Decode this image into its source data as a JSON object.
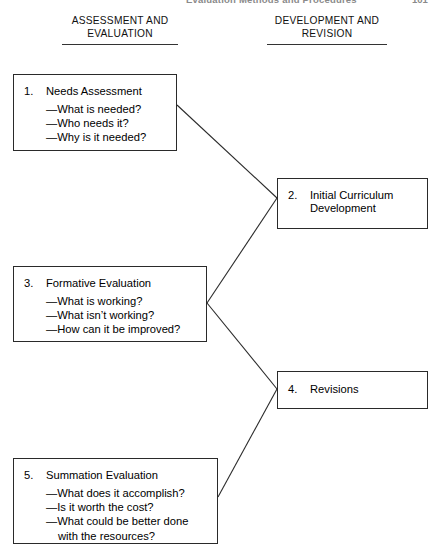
{
  "running_head": {
    "title": "Evaluation Methods and Procedures",
    "page_number": "101"
  },
  "columns": [
    {
      "id": "assessment-evaluation",
      "line1": "ASSESSMENT AND",
      "line2": "EVALUATION"
    },
    {
      "id": "development-revision",
      "line1": "DEVELOPMENT AND",
      "line2": "REVISION"
    }
  ],
  "nodes": [
    {
      "id": "needs-assessment",
      "number": "1.",
      "title": "Needs Assessment",
      "bullets": [
        "—What is needed?",
        "—Who needs it?",
        "—Why is it needed?"
      ]
    },
    {
      "id": "initial-curriculum-development",
      "number": "2.",
      "title": "Initial Curriculum",
      "title_cont": "Development",
      "bullets": []
    },
    {
      "id": "formative-evaluation",
      "number": "3.",
      "title": "Formative Evaluation",
      "bullets": [
        "—What is working?",
        "—What isn’t working?",
        "—How can it be improved?"
      ]
    },
    {
      "id": "revisions",
      "number": "4.",
      "title": "Revisions",
      "bullets": []
    },
    {
      "id": "summation-evaluation",
      "number": "5.",
      "title": "Summation Evaluation",
      "bullets": [
        "—What does it accomplish?",
        "—Is it worth the cost?",
        "—What could be better done"
      ],
      "bullet_cont": "with the resources?"
    }
  ],
  "connectors": [
    {
      "id": "needs-assessment-to-initial-curriculum",
      "from": "needs-assessment",
      "to": "initial-curriculum-development",
      "x1": 177,
      "y1": 105,
      "x2": 277,
      "y2": 198
    },
    {
      "id": "formative-evaluation-to-initial-curriculum",
      "from": "formative-evaluation",
      "to": "initial-curriculum-development",
      "x1": 207,
      "y1": 303,
      "x2": 277,
      "y2": 198
    },
    {
      "id": "formative-evaluation-to-revisions",
      "from": "formative-evaluation",
      "to": "revisions",
      "x1": 207,
      "y1": 303,
      "x2": 277,
      "y2": 389
    },
    {
      "id": "summation-evaluation-to-revisions",
      "from": "summation-evaluation",
      "to": "revisions",
      "x1": 218,
      "y1": 497,
      "x2": 277,
      "y2": 389
    }
  ],
  "style": {
    "line_color": "#2a2a2a",
    "box_border_color": "#2a2a2a",
    "background": "#ffffff",
    "text_color": "#000000"
  }
}
